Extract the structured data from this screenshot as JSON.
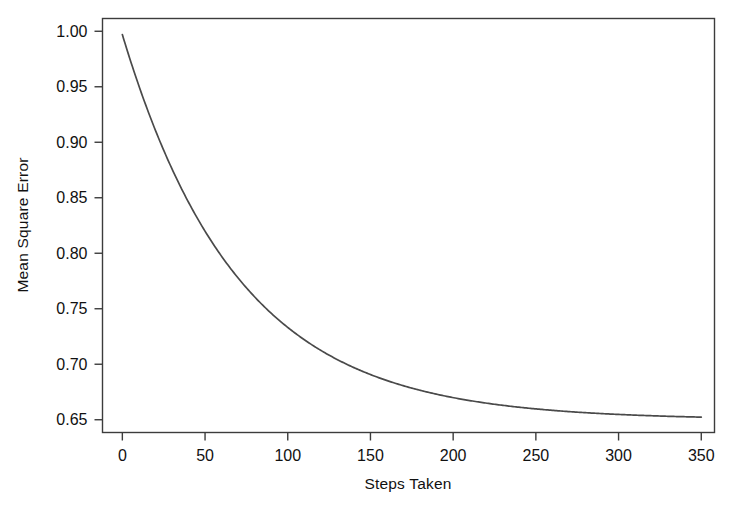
{
  "figure": {
    "background_color": "#ffffff",
    "frame_color": "#3c3c3c",
    "text_color": "#111111"
  },
  "chart_data": {
    "type": "line",
    "title": "",
    "xlabel": "Steps Taken",
    "ylabel": "Mean Square Error",
    "xlim": [
      -12,
      358
    ],
    "ylim": [
      0.6385,
      1.0115
    ],
    "xticks": [
      0,
      50,
      100,
      150,
      200,
      250,
      300,
      350
    ],
    "xtick_labels": [
      "0",
      "50",
      "100",
      "150",
      "200",
      "250",
      "300",
      "350"
    ],
    "yticks": [
      0.65,
      0.7,
      0.75,
      0.8,
      0.85,
      0.9,
      0.95,
      1.0
    ],
    "ytick_labels": [
      "0.65",
      "0.70",
      "0.75",
      "0.80",
      "0.85",
      "0.90",
      "0.95",
      "1.00"
    ],
    "grid": false,
    "legend": null,
    "legend_position": "none",
    "series": [
      {
        "name": "Mean Square Error",
        "color": "#4a4a4a",
        "line_width": 1.7,
        "x": [
          0,
          5,
          10,
          15,
          20,
          25,
          30,
          35,
          40,
          45,
          50,
          55,
          60,
          65,
          70,
          75,
          80,
          85,
          90,
          95,
          100,
          105,
          110,
          115,
          120,
          125,
          130,
          135,
          140,
          145,
          150,
          155,
          160,
          165,
          170,
          175,
          180,
          185,
          190,
          195,
          200,
          205,
          210,
          215,
          220,
          225,
          230,
          235,
          240,
          245,
          250,
          255,
          260,
          265,
          270,
          275,
          280,
          285,
          290,
          295,
          300,
          305,
          310,
          315,
          320,
          325,
          330,
          335,
          340,
          345,
          350
        ],
        "y": [
          0.997,
          0.974,
          0.951,
          0.93,
          0.909,
          0.89,
          0.871,
          0.854,
          0.837,
          0.821,
          0.868,
          0.856,
          0.843,
          0.831,
          0.819,
          0.808,
          0.797,
          0.787,
          0.777,
          0.767,
          0.774,
          0.766,
          0.757,
          0.749,
          0.742,
          0.734,
          0.727,
          0.721,
          0.714,
          0.708,
          0.696,
          0.692,
          0.688,
          0.684,
          0.68,
          0.677,
          0.674,
          0.671,
          0.668,
          0.666,
          0.666,
          0.664,
          0.662,
          0.66,
          0.659,
          0.657,
          0.656,
          0.655,
          0.654,
          0.653,
          0.652,
          0.652,
          0.651,
          0.651,
          0.65,
          0.65,
          0.65,
          0.65,
          0.65,
          0.65,
          0.6505,
          0.6505,
          0.65,
          0.65,
          0.65,
          0.65,
          0.65,
          0.65,
          0.6505,
          0.6505,
          0.65
        ],
        "model": {
          "form": "asymptote + amplitude * exp(-x / tau)",
          "asymptote": 0.65,
          "amplitude": 0.347,
          "tau": 70
        }
      }
    ]
  }
}
